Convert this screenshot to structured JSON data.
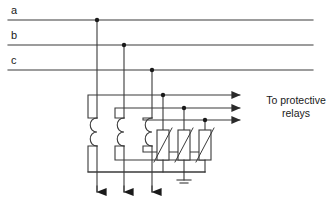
{
  "diagram": {
    "type": "electrical-schematic",
    "colors": {
      "wire": "#3a3a3a",
      "text": "#1a1a1a",
      "background": "#ffffff",
      "node": "#1a1a1a"
    },
    "phase_labels": [
      {
        "id": "a",
        "text": "a",
        "x": 13,
        "y": 6,
        "line_y": 20
      },
      {
        "id": "b",
        "text": "b",
        "x": 13,
        "y": 31,
        "line_y": 45
      },
      {
        "id": "c",
        "text": "c",
        "x": 13,
        "y": 56,
        "line_y": 70
      }
    ],
    "annotation": {
      "name": "to-protective-relays",
      "line1": "To protective",
      "line2": "relays",
      "x": 253,
      "y": 94
    },
    "bus_lines": [
      {
        "name": "phase-a-bus",
        "y": 20,
        "x1": 8,
        "x2": 313
      },
      {
        "name": "phase-b-bus",
        "y": 45,
        "x1": 8,
        "x2": 313
      },
      {
        "name": "phase-c-bus",
        "y": 70,
        "x1": 8,
        "x2": 313
      }
    ],
    "drop_conductors": [
      {
        "name": "phase-a-drop",
        "x": 97,
        "y_top": 20,
        "y_bottom": 202
      },
      {
        "name": "phase-b-drop",
        "x": 124,
        "y_top": 45,
        "y_bottom": 202
      },
      {
        "name": "phase-c-drop",
        "x": 152,
        "y_top": 70,
        "y_bottom": 202
      }
    ],
    "current_transformers": [
      {
        "name": "ct-phase-a",
        "x": 97,
        "coil_top": 118,
        "coil_bottom": 146
      },
      {
        "name": "ct-phase-b",
        "x": 124,
        "coil_top": 118,
        "coil_bottom": 146
      },
      {
        "name": "ct-phase-c",
        "x": 152,
        "coil_top": 118,
        "coil_bottom": 146
      }
    ],
    "secondary_leads": [
      {
        "name": "secondary-lead-a",
        "y": 95,
        "arrow_x": 248
      },
      {
        "name": "secondary-lead-b",
        "y": 108,
        "arrow_x": 248
      },
      {
        "name": "secondary-lead-c",
        "y": 120,
        "arrow_x": 248
      }
    ],
    "burden_resistors": [
      {
        "name": "burden-resistor-a",
        "x": 163,
        "y_top": 130,
        "y_bottom": 160
      },
      {
        "name": "burden-resistor-b",
        "x": 184,
        "y_top": 130,
        "y_bottom": 160
      },
      {
        "name": "burden-resistor-c",
        "x": 205,
        "y_top": 130,
        "y_bottom": 160
      }
    ],
    "common_return_bus": {
      "name": "common-return-bus",
      "y": 172,
      "x1": 97,
      "x2": 205
    },
    "ground": {
      "name": "earth-ground",
      "x": 184,
      "y_top": 172,
      "y_bottom": 181
    },
    "junction_nodes": [
      {
        "name": "node-a-bus",
        "x": 97,
        "y": 20
      },
      {
        "name": "node-b-bus",
        "x": 124,
        "y": 45
      },
      {
        "name": "node-c-bus",
        "x": 152,
        "y": 70
      },
      {
        "name": "node-secondary-a",
        "x": 163,
        "y": 95
      },
      {
        "name": "node-secondary-b",
        "x": 184,
        "y": 108
      },
      {
        "name": "node-secondary-c",
        "x": 205,
        "y": 120
      }
    ],
    "load_arrows": [
      {
        "name": "load-arrow-a",
        "x": 97,
        "y": 202
      },
      {
        "name": "load-arrow-b",
        "x": 124,
        "y": 202
      },
      {
        "name": "load-arrow-c",
        "x": 152,
        "y": 202
      }
    ]
  }
}
